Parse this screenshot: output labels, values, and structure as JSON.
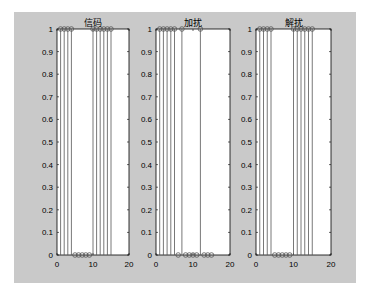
{
  "chart_data": [
    {
      "type": "stem",
      "title": "信码",
      "xlabel": "",
      "ylabel": "",
      "xlim": [
        0,
        20
      ],
      "ylim": [
        0,
        1
      ],
      "xticks": [
        0,
        10,
        20
      ],
      "yticks": [
        0,
        0.1,
        0.2,
        0.3,
        0.4,
        0.5,
        0.6,
        0.7,
        0.8,
        0.9,
        1
      ],
      "x": [
        1,
        2,
        3,
        4,
        5,
        6,
        7,
        8,
        9,
        10,
        11,
        12,
        13,
        14,
        15
      ],
      "values": [
        1,
        1,
        1,
        1,
        0,
        0,
        0,
        0,
        0,
        1,
        1,
        1,
        1,
        1,
        1
      ]
    },
    {
      "type": "stem",
      "title": "加扰",
      "xlabel": "",
      "ylabel": "",
      "xlim": [
        0,
        20
      ],
      "ylim": [
        0,
        1
      ],
      "xticks": [
        0,
        10,
        20
      ],
      "yticks": [
        0,
        0.1,
        0.2,
        0.3,
        0.4,
        0.5,
        0.6,
        0.7,
        0.8,
        0.9,
        1
      ],
      "x": [
        1,
        2,
        3,
        4,
        5,
        6,
        7,
        8,
        9,
        10,
        11,
        12,
        13,
        14,
        15
      ],
      "values": [
        1,
        1,
        1,
        1,
        1,
        0,
        1,
        0,
        0,
        0,
        0,
        1,
        0,
        0,
        0
      ]
    },
    {
      "type": "stem",
      "title": "解扰",
      "xlabel": "",
      "ylabel": "",
      "xlim": [
        0,
        20
      ],
      "ylim": [
        0,
        1
      ],
      "xticks": [
        0,
        10,
        20
      ],
      "yticks": [
        0,
        0.1,
        0.2,
        0.3,
        0.4,
        0.5,
        0.6,
        0.7,
        0.8,
        0.9,
        1
      ],
      "x": [
        1,
        2,
        3,
        4,
        5,
        6,
        7,
        8,
        9,
        10,
        11,
        12,
        13,
        14,
        15
      ],
      "values": [
        1,
        1,
        1,
        1,
        0,
        0,
        0,
        0,
        0,
        1,
        1,
        1,
        1,
        1,
        1
      ]
    }
  ],
  "style": {
    "figure_bg": "#c9c9c9",
    "axes_bg": "#ffffff",
    "stem_color": "#555555",
    "axis_color": "#000000"
  },
  "layout": {
    "axes": [
      {
        "left": 57,
        "right": 129
      },
      {
        "left": 156,
        "right": 230
      },
      {
        "left": 256,
        "right": 331
      }
    ],
    "top": 29,
    "bottom": 255
  }
}
